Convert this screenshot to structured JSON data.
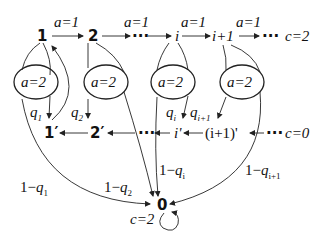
{
  "diagram": {
    "top_row": {
      "nodes": [
        "1",
        "2",
        "···",
        "i",
        "i+1",
        "···"
      ],
      "edge_label": "a=1",
      "class_label": "c=2"
    },
    "middle": {
      "condition_label": "a=2",
      "probabilities": [
        "q",
        "q",
        "q",
        "q"
      ],
      "prob_subscripts": [
        "1",
        "2",
        "i",
        "i+1"
      ]
    },
    "bottom_row": {
      "nodes": [
        "1′",
        "2′",
        "···",
        "i'",
        "(i+1)'",
        "···"
      ],
      "class_label": "c=0"
    },
    "sink": {
      "node": "0",
      "class_label": "c=2",
      "incoming_labels": [
        {
          "prefix": "1−",
          "var": "q",
          "sub": "1"
        },
        {
          "prefix": "1−",
          "var": "q",
          "sub": "2"
        },
        {
          "prefix": "1−",
          "var": "q",
          "sub": "i"
        },
        {
          "prefix": "1−",
          "var": "q",
          "sub": "i+1"
        }
      ]
    }
  }
}
